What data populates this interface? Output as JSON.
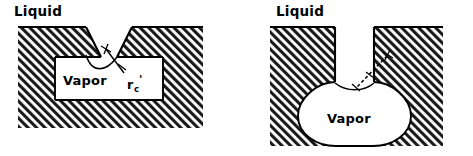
{
  "figure": {
    "background_color": "#ffffff",
    "line_color": "#000000",
    "hatch_color": "#1a1a1a"
  },
  "panels": [
    {
      "id": "left",
      "name": "reentrant-conical-cavity",
      "labels": {
        "liquid": "Liquid",
        "vapor": "Vapor",
        "radius_symbol": "r",
        "radius_subscript": "c",
        "radius_prime": "'"
      },
      "cavity_shape": "trapezoidal funnel narrowing to a throat, opening into a wide rectangular vapor chamber",
      "meniscus": "concave curve spanning the throat, dipping into the vapor chamber",
      "annotation": "radius-of-curvature arrow with cross mark at center of curvature"
    },
    {
      "id": "right",
      "name": "reentrant-slot-cavity",
      "labels": {
        "liquid": "Liquid",
        "vapor": "Vapor"
      },
      "cavity_shape": "narrow vertical slot opening into a rounded U-shaped vapor bulb",
      "meniscus": "shallow concave curve across the top of the bulb",
      "annotation": "dashed radius arrow with cross mark at center of curvature"
    }
  ]
}
